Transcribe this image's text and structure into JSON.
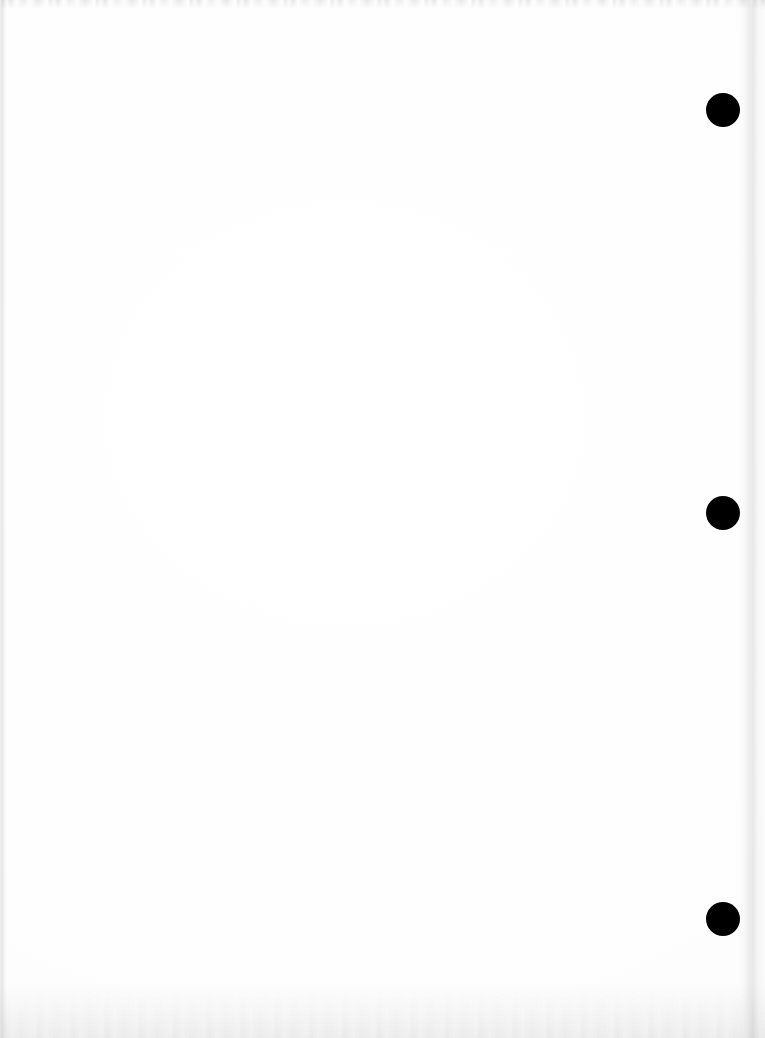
{
  "page": {
    "kind": "scanned-blank-page",
    "width": 765,
    "height": 1038,
    "background_color": "#ffffff",
    "paper_tone": "#fefefe",
    "body_text": "",
    "visible_text": []
  },
  "marks": {
    "label": "punch-holes",
    "color": "#000000",
    "shape": "circle",
    "count": 3,
    "items": [
      {
        "name": "punch-mark-top",
        "cx": 723,
        "cy": 110,
        "diameter": 34
      },
      {
        "name": "punch-mark-middle",
        "cx": 723,
        "cy": 513,
        "diameter": 34
      },
      {
        "name": "punch-mark-bottom",
        "cx": 723,
        "cy": 919,
        "diameter": 34
      }
    ]
  },
  "scan_artifacts": {
    "top_band": {
      "name": "scan-top-artifact",
      "color": "#969696",
      "height": 9
    },
    "left_edge": {
      "name": "page-edge-left",
      "color": "#8c8c8c",
      "width": 7
    },
    "right_edge": {
      "name": "page-edge-right",
      "color": "#969696",
      "x": 738,
      "width": 27
    },
    "bottom_edge": {
      "name": "page-edge-bottom",
      "color": "#9b9b9b",
      "height": 56
    }
  }
}
